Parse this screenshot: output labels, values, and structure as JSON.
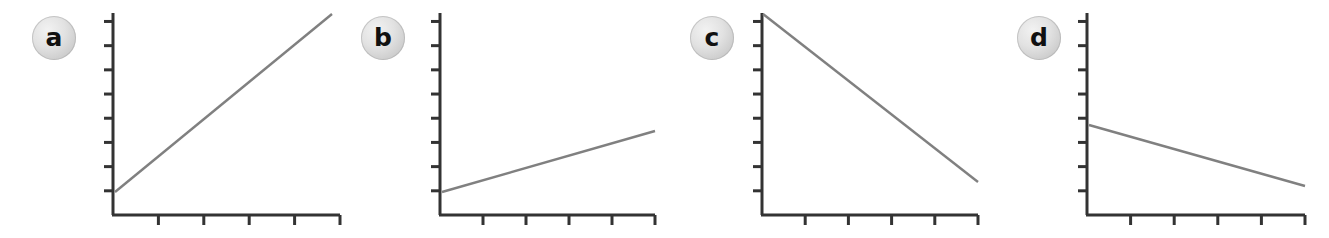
{
  "figure": {
    "title": "",
    "background_color": "#ffffff",
    "axis_color": "#333333",
    "line_color": "#808080",
    "badge_fill_color": "#dcdcdc",
    "badge_text_color": "#111111",
    "panel_count": 4
  },
  "chart_data": [
    {
      "type": "line",
      "label": "a",
      "title": "",
      "xlabel": "",
      "ylabel": "",
      "grid": false,
      "legend": "none",
      "xlim": [
        0,
        5
      ],
      "ylim": [
        0,
        8
      ],
      "x_tick_count": 5,
      "y_tick_count": 8,
      "tick_labels_shown": false,
      "x": [
        0,
        5
      ],
      "y": [
        1,
        8
      ],
      "slope": "steep-positive",
      "description": "strong increasing linear trend"
    },
    {
      "type": "line",
      "label": "b",
      "title": "",
      "xlabel": "",
      "ylabel": "",
      "grid": false,
      "legend": "none",
      "xlim": [
        0,
        5
      ],
      "ylim": [
        0,
        8
      ],
      "x_tick_count": 5,
      "y_tick_count": 8,
      "tick_labels_shown": false,
      "x": [
        0,
        5
      ],
      "y": [
        1,
        3.4
      ],
      "slope": "shallow-positive",
      "description": "weak increasing linear trend"
    },
    {
      "type": "line",
      "label": "c",
      "title": "",
      "xlabel": "",
      "ylabel": "",
      "grid": false,
      "legend": "none",
      "xlim": [
        0,
        5
      ],
      "ylim": [
        0,
        8
      ],
      "x_tick_count": 5,
      "y_tick_count": 8,
      "tick_labels_shown": false,
      "x": [
        0,
        5
      ],
      "y": [
        8,
        1.3
      ],
      "slope": "steep-negative",
      "description": "strong decreasing linear trend"
    },
    {
      "type": "line",
      "label": "d",
      "title": "",
      "xlabel": "",
      "ylabel": "",
      "grid": false,
      "legend": "none",
      "xlim": [
        0,
        5
      ],
      "ylim": [
        0,
        8
      ],
      "x_tick_count": 5,
      "y_tick_count": 8,
      "tick_labels_shown": false,
      "x": [
        0,
        5
      ],
      "y": [
        3.6,
        1.15
      ],
      "slope": "shallow-negative",
      "description": "weak decreasing linear trend"
    }
  ],
  "panels": [
    {
      "badge": "a",
      "badge_name": "panel-label-a",
      "left": 0,
      "badge_left": 32,
      "badge_top": 16,
      "origin_x": 113,
      "origin_y": 215,
      "axis_top_y": 13,
      "axis_right_x": 340,
      "line_x1": 115,
      "line_y1": 192,
      "line_x2": 332,
      "line_y2": 14
    },
    {
      "badge": "b",
      "badge_name": "panel-label-b",
      "left": 0,
      "badge_left": 361,
      "badge_top": 16,
      "origin_x": 440,
      "origin_y": 215,
      "axis_top_y": 13,
      "axis_right_x": 655,
      "line_x1": 442,
      "line_y1": 192,
      "line_x2": 655,
      "line_y2": 131
    },
    {
      "badge": "c",
      "badge_name": "panel-label-c",
      "left": 0,
      "badge_left": 690,
      "badge_top": 16,
      "origin_x": 762,
      "origin_y": 215,
      "axis_top_y": 13,
      "axis_right_x": 978,
      "line_x1": 763,
      "line_y1": 14,
      "line_x2": 978,
      "line_y2": 182
    },
    {
      "badge": "d",
      "badge_name": "panel-label-d",
      "left": 0,
      "badge_left": 1017,
      "badge_top": 16,
      "origin_x": 1087,
      "origin_y": 215,
      "axis_top_y": 13,
      "axis_right_x": 1305,
      "line_x1": 1089,
      "line_y1": 125,
      "line_x2": 1305,
      "line_y2": 186
    }
  ]
}
